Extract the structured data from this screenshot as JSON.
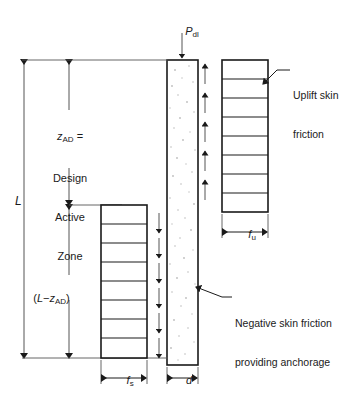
{
  "figure": {
    "type": "engineering-diagram"
  },
  "loads": {
    "dead_load_symbol": "P",
    "dead_load_subscript": "dl"
  },
  "dimensions": {
    "total_length_symbol": "L",
    "active_zone_symbol": "z",
    "active_zone_subscript": "AD",
    "active_zone_equals": "=",
    "active_zone_desc_line1": "Design",
    "active_zone_desc_line2": "Active",
    "active_zone_desc_line3": "Zone",
    "anchorage_length_open": "(",
    "anchorage_length_L": "L",
    "anchorage_length_minus": "−",
    "anchorage_length_z": "z",
    "anchorage_length_sub": "AD",
    "anchorage_length_close": ")",
    "skin_friction_symbol": "f",
    "skin_friction_subscript": "s",
    "uplift_friction_symbol": "f",
    "uplift_friction_subscript": "u",
    "diameter_symbol": "d"
  },
  "annotations": {
    "uplift_line1": "Uplift skin",
    "uplift_line2": "friction",
    "negative_line1": "Negative skin friction",
    "negative_line2": "providing anchorage"
  },
  "style": {
    "line_color": "#1a1a1a",
    "thin_line_color": "#555555",
    "fill_color": "#ffffff",
    "stipple_color": "#b8b8b8",
    "background": "#ffffff"
  },
  "geometry": {
    "pile_cells": 0,
    "uplift_block_cells": 8,
    "anchorage_block_cells": 8,
    "uplift_arrows": 5,
    "negative_arrows": 6
  }
}
